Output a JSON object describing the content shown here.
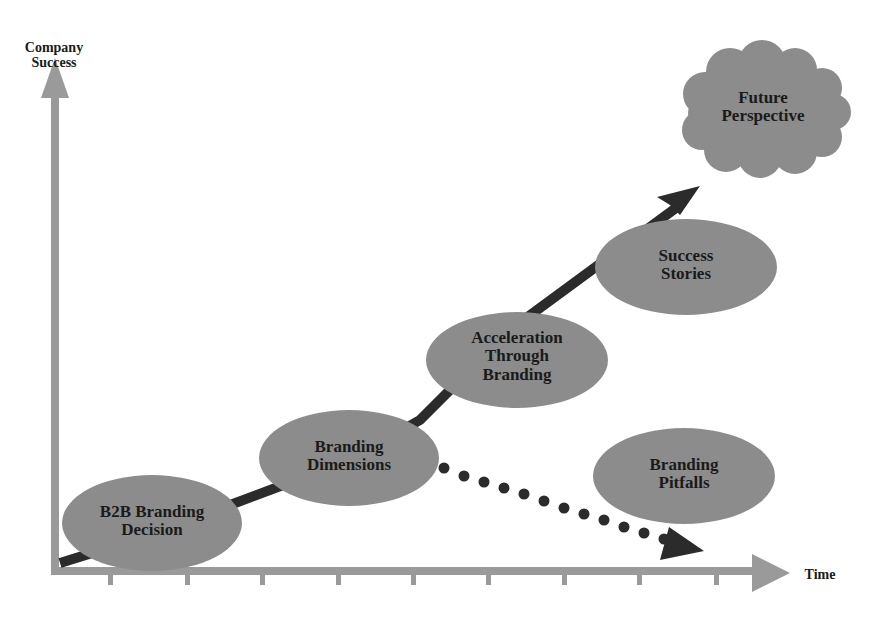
{
  "axes": {
    "y_label_line1": "Company",
    "y_label_line2": "Success",
    "x_label": "Time",
    "tick_count": 9
  },
  "nodes": [
    {
      "id": "b2b",
      "line1": "B2B Branding",
      "line2": "Decision"
    },
    {
      "id": "dimensions",
      "line1": "Branding",
      "line2": "Dimensions"
    },
    {
      "id": "acceleration",
      "line1": "Acceleration",
      "line2": "Through",
      "line3": "Branding"
    },
    {
      "id": "success",
      "line1": "Success",
      "line2": "Stories"
    },
    {
      "id": "pitfalls",
      "line1": "Branding",
      "line2": "Pitfalls"
    }
  ],
  "cloud": {
    "line1": "Future",
    "line2": "Perspective"
  },
  "colors": {
    "node_fill": "#8c8c8c",
    "axis": "#999999",
    "path": "#2b2b2b",
    "text": "#1a1a1a"
  }
}
